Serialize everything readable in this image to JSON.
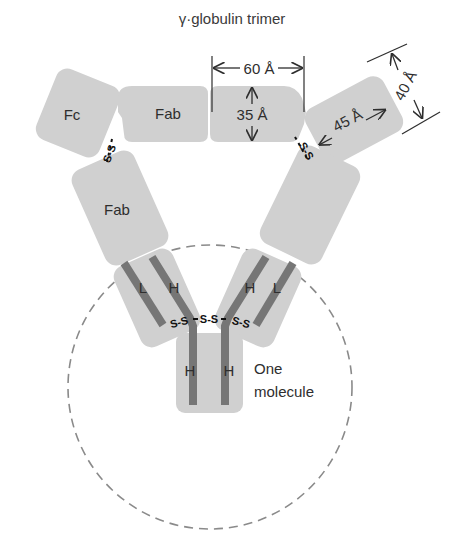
{
  "title": "γ·globulin trimer",
  "labels": {
    "fc": "Fc",
    "fab_top": "Fab",
    "fab_left": "Fab",
    "light_left": "L",
    "heavy_left": "H",
    "heavy_right": "H",
    "light_right": "L",
    "heavy_stem_left": "H",
    "heavy_stem_right": "H",
    "one_molecule_line1": "One",
    "one_molecule_line2": "molecule"
  },
  "dimensions": {
    "width": "60 Å",
    "height": "35 Å",
    "length": "45 Å",
    "depth": "40 Å"
  },
  "disulfide": {
    "bond": "S-S",
    "hinge": "S-S"
  },
  "colors": {
    "block_fill": "#d0d0d0",
    "chain": "#767676",
    "circle": "#8a8a8a",
    "text": "#2e2e2e"
  }
}
